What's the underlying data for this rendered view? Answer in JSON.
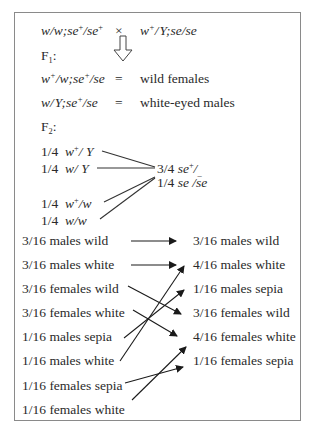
{
  "cross": {
    "female_parent": {
      "w1": "w",
      "sep": "/",
      "w2": "w",
      "semi": ";",
      "se1": "se",
      "sup1": "+",
      "slash": "/",
      "se2": "se",
      "sup2": "+"
    },
    "times": "×",
    "male_parent": {
      "w": "w",
      "sup": "+",
      "slash": "/",
      "y": "Y",
      "semi": ";",
      "se1": "se",
      "slash2": "/",
      "se2": "se"
    }
  },
  "f1": {
    "label": "F",
    "sub": "1",
    "colon": ":",
    "arrow_icon": "hollow-down-arrow",
    "rows": [
      {
        "genotype": {
          "a": "w",
          "asup": "+",
          "b": "/w;",
          "c": "se",
          "csup": "+",
          "d": "/se"
        },
        "eq": "=",
        "phenotype": "wild females"
      },
      {
        "genotype": {
          "a": "w/",
          "b": "Y;",
          "c": "se",
          "csup": "+",
          "d": "/se"
        },
        "eq": "=",
        "phenotype": "white-eyed males"
      }
    ]
  },
  "f2": {
    "label": "F",
    "sub": "2",
    "colon": ":",
    "x_linked": [
      {
        "fraction": "1/4",
        "geno_a": "w",
        "geno_sup": "+",
        "geno_b": "/ Y"
      },
      {
        "fraction": "1/4",
        "geno_a": "w",
        "geno_sup": "",
        "geno_b": "/ Y"
      },
      {
        "fraction": "1/4",
        "geno_a": "w",
        "geno_sup": "+",
        "geno_b": "/w"
      },
      {
        "fraction": "1/4",
        "geno_a": "w",
        "geno_sup": "",
        "geno_b": "/w"
      }
    ],
    "autosomal": [
      {
        "fraction": "3/4",
        "geno_a": "se",
        "geno_sup": "+",
        "geno_b": "/",
        "geno_sub": "_"
      },
      {
        "fraction": "1/4",
        "geno_a": "se /se",
        "geno_sup": "",
        "geno_b": "",
        "geno_sub": ""
      }
    ]
  },
  "phenotypes": {
    "left": [
      "3/16 males wild",
      "3/16 males white",
      "3/16 females wild",
      "3/16 females white",
      "1/16 males sepia",
      "1/16 males white",
      "1/16 females sepia",
      "1/16 females white"
    ],
    "right": [
      "3/16 males wild",
      "4/16 males white",
      "1/16 males sepia",
      "3/16 females wild",
      "4/16 females white",
      "1/16 females sepia"
    ],
    "mapping": [
      {
        "from": 0,
        "to": 0
      },
      {
        "from": 1,
        "to": 1
      },
      {
        "from": 2,
        "to": 3
      },
      {
        "from": 3,
        "to": 4
      },
      {
        "from": 4,
        "to": 2
      },
      {
        "from": 5,
        "to": 1
      },
      {
        "from": 6,
        "to": 5
      },
      {
        "from": 7,
        "to": 4
      }
    ]
  },
  "colors": {
    "text": "#2a2a2a",
    "border": "#8a8a8a",
    "line": "#1a1a1a"
  }
}
